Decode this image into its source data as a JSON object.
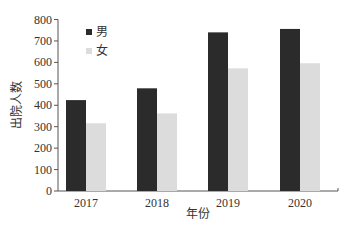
{
  "chart_data": {
    "type": "bar",
    "title": "",
    "xlabel": "年份",
    "ylabel": "出院人数",
    "categories": [
      "2017",
      "2018",
      "2019",
      "2020"
    ],
    "series": [
      {
        "name": "男",
        "color": "#2b2b2b",
        "values": [
          424,
          479,
          740,
          756
        ]
      },
      {
        "name": "女",
        "color": "#dcdcdc",
        "values": [
          316,
          362,
          572,
          596
        ]
      }
    ],
    "ylim": [
      0,
      800
    ],
    "yticks": [
      0,
      100,
      200,
      300,
      400,
      500,
      600,
      700,
      800
    ],
    "grid": false,
    "legend_position": "upper-left-inside"
  }
}
